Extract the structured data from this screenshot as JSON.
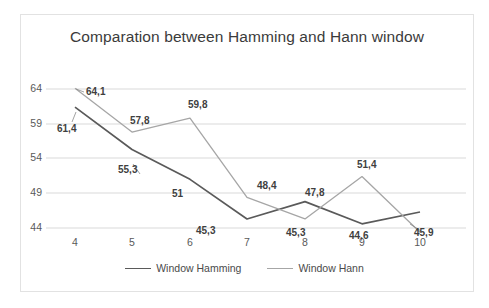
{
  "chart_data": {
    "type": "line",
    "title": "Comparation between Hamming and Hann window",
    "xlabel": "",
    "ylabel": "",
    "categories": [
      "4",
      "5",
      "6",
      "7",
      "8",
      "9",
      "10"
    ],
    "x": [
      4,
      5,
      6,
      7,
      8,
      9,
      10
    ],
    "xlim": [
      4,
      10
    ],
    "ylim": [
      44,
      64
    ],
    "yticks": [
      "44",
      "49",
      "54",
      "59",
      "64"
    ],
    "ytick_values": [
      44,
      49,
      54,
      59,
      64
    ],
    "grid": true,
    "legend_position": "bottom",
    "series": [
      {
        "name": "Window Hamming",
        "color": "#5a5a5a",
        "values": [
          61.4,
          55.3,
          51.0,
          45.3,
          47.8,
          44.6,
          46.3
        ],
        "labels": [
          "61,4",
          "55,3",
          "51",
          "45,3",
          "47,8",
          "44,6",
          "45,9"
        ]
      },
      {
        "name": "Window Hann",
        "color": "#a6a6a6",
        "values": [
          64.1,
          57.8,
          59.8,
          48.4,
          45.3,
          51.4,
          43.4
        ],
        "labels": [
          "64,1",
          "57,8",
          "59,8",
          "48,4",
          "45,3",
          "51,4",
          ""
        ]
      }
    ],
    "data_labels": [
      {
        "text": "64,1",
        "x": 86,
        "y": 86
      },
      {
        "text": "61,4",
        "x": 57,
        "y": 123
      },
      {
        "text": "57,8",
        "x": 130,
        "y": 115
      },
      {
        "text": "55,3",
        "x": 118,
        "y": 164
      },
      {
        "text": "59,8",
        "x": 188,
        "y": 99
      },
      {
        "text": "51",
        "x": 172,
        "y": 188
      },
      {
        "text": "48,4",
        "x": 257,
        "y": 180
      },
      {
        "text": "45,3",
        "x": 196,
        "y": 225
      },
      {
        "text": "47,8",
        "x": 305,
        "y": 187
      },
      {
        "text": "45,3",
        "x": 286,
        "y": 227
      },
      {
        "text": "51,4",
        "x": 357,
        "y": 159
      },
      {
        "text": "44,6",
        "x": 349,
        "y": 230
      },
      {
        "text": "45,9",
        "x": 414,
        "y": 227
      }
    ],
    "axis": {
      "y_tick_positions": [
        {
          "label": "64",
          "y": 89
        },
        {
          "label": "59",
          "y": 124
        },
        {
          "label": "54",
          "y": 158
        },
        {
          "label": "49",
          "y": 193
        },
        {
          "label": "44",
          "y": 228
        }
      ],
      "x_tick_positions": [
        {
          "label": "4",
          "x": 63
        },
        {
          "label": "5",
          "x": 120
        },
        {
          "label": "6",
          "x": 178
        },
        {
          "label": "7",
          "x": 235
        },
        {
          "label": "8",
          "x": 293
        },
        {
          "label": "9",
          "x": 350
        },
        {
          "label": "10",
          "x": 408
        }
      ]
    }
  },
  "colors": {
    "hamming": "#5a5a5a",
    "hann": "#a6a6a6",
    "grid": "#d9d9d9",
    "border": "#e2e2e2",
    "text": "#595959",
    "title": "#3b3b3b"
  }
}
